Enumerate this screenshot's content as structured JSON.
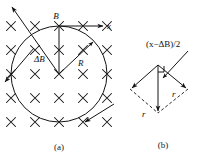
{
  "figure": {
    "background_color": "#ffffff",
    "ink_color": "#141414",
    "panels": [
      {
        "id": "a",
        "caption": "(a)",
        "description": "Circle of radius R inside a uniform magnetic field directed into the page, shown by a grid of cross marks.",
        "labels": {
          "field_into_page_symbol": "×",
          "b_vector": "B",
          "x_axis": "x",
          "delta_b_vector": "ΔB",
          "radius": "R"
        }
      },
      {
        "id": "b",
        "caption": "(b)",
        "description": "Vector rhombus with a vertical resultant arrow and two equal sides labelled r.",
        "labels": {
          "top_expression": "(x−ΔB)/2",
          "side_right": "r",
          "side_bottom": "r"
        }
      }
    ]
  },
  "panel_a": {
    "caption": "(a)",
    "labels": {
      "B": "B",
      "x": "x",
      "deltaB": "ΔB",
      "R": "R"
    },
    "cross_grid": {
      "symbol": "×",
      "columns": 5,
      "rows": 5,
      "x_start": 11,
      "x_step": 24,
      "y_start": 26,
      "y_step": 24,
      "count": 25
    },
    "circle": {
      "center_x": 59,
      "center_y": 74,
      "radius": 48
    },
    "vectors": {
      "B": {
        "from_x": 59,
        "from_y": 74,
        "to_x": 59,
        "to_y": 26,
        "label": "B"
      },
      "x_axis": {
        "from_x": 59,
        "from_y": 26,
        "to_x": 104,
        "to_y": 26,
        "label": "x"
      },
      "deltaB": {
        "from_x": 59,
        "from_y": 74,
        "to_x": 10,
        "to_y": 5,
        "label": "ΔB"
      },
      "R": {
        "from_x": 59,
        "from_y": 74,
        "to_x": 94,
        "to_y": 41,
        "label": "R"
      },
      "tangent_bottom_right": {
        "from_x": 112,
        "from_y": 105,
        "to_x": 83,
        "to_y": 124
      },
      "tangent_left": {
        "from_x": 36,
        "from_y": 50,
        "to_x": 4,
        "to_y": 83
      }
    }
  },
  "panel_b": {
    "caption": "(b)",
    "labels": {
      "expression": "(x−ΔB)/2",
      "r_right": "r",
      "r_bottom": "r"
    },
    "rhombus": {
      "top_x": 158,
      "top_y": 65,
      "left_x": 130,
      "left_y": 89,
      "right_x": 188,
      "right_y": 89,
      "bottom_x": 158,
      "bottom_y": 113
    },
    "vectors": {
      "resultant": {
        "from_x": 158,
        "from_y": 65,
        "to_x": 158,
        "to_y": 113
      },
      "to_left": {
        "from_x": 158,
        "from_y": 65,
        "to_x": 130,
        "to_y": 89
      },
      "to_right": {
        "from_x": 158,
        "from_y": 65,
        "to_x": 188,
        "to_y": 89
      },
      "pointer": {
        "from_x": 186,
        "from_y": 52,
        "to_x": 164,
        "to_y": 77
      }
    },
    "dashed_edges": [
      {
        "from_x": 130,
        "from_y": 89,
        "to_x": 158,
        "to_y": 113
      },
      {
        "from_x": 188,
        "from_y": 89,
        "to_x": 158,
        "to_y": 113
      }
    ],
    "right_angle_marker": {
      "x": 158,
      "y": 65,
      "size": 7
    }
  }
}
